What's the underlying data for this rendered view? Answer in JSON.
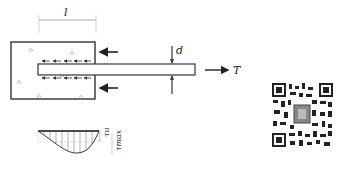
{
  "diagram": {
    "type": "rebar-pullout-bond-stress",
    "labels": {
      "embed_length": "l",
      "bar_diameter": "d",
      "pull_force": "T",
      "bond_stress_avg": "τu",
      "bond_stress_max": "τmax"
    },
    "components": {
      "concrete_block": "concrete-specimen",
      "rebar": "steel-bar",
      "reaction_arrows": 2,
      "bond_stress_arrows_top": 5,
      "bond_stress_arrows_bottom": 5
    },
    "bond_stress_distribution": {
      "shape": "curved, peak near middle-right",
      "reference_lines": [
        "τu",
        "τmax"
      ]
    },
    "qr_code": {
      "present": true
    }
  }
}
